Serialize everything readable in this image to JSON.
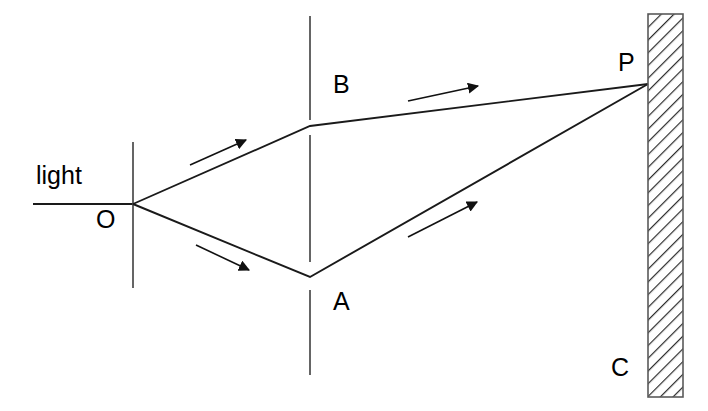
{
  "figure": {
    "background_color": "#ffffff",
    "line_color": "#1a1a1a",
    "width": 708,
    "height": 411
  },
  "labels": {
    "source": "light",
    "pinhole": "O",
    "slit_upper": "B",
    "slit_lower": "A",
    "screen_point": "P",
    "screen": "C"
  },
  "elements": {
    "incoming_ray": {
      "name": "incoming-light-ray",
      "x1": 33,
      "y1": 204,
      "x2": 133,
      "y2": 204
    },
    "first_barrier": {
      "name": "pinhole-barrier",
      "x": 133,
      "y1": 142,
      "y2": 288
    },
    "second_barrier_segments": [
      {
        "x": 310,
        "y1": 16,
        "y2": 120
      },
      {
        "x": 310,
        "y1": 135,
        "y2": 262
      },
      {
        "x": 310,
        "y1": 290,
        "y2": 375
      }
    ],
    "rays": [
      {
        "name": "ray-o-to-b",
        "points": "133,204 310,126"
      },
      {
        "name": "ray-b-to-p",
        "points": "310,126 648,84"
      },
      {
        "name": "ray-o-to-a",
        "points": "133,204 310,277"
      },
      {
        "name": "ray-a-to-p",
        "points": "310,277 648,84"
      }
    ],
    "arrows": [
      {
        "name": "arrow-o-to-b",
        "x": 232,
        "y": 143,
        "angle": -24
      },
      {
        "name": "arrow-b-to-p",
        "x": 462,
        "y": 90,
        "angle": -7
      },
      {
        "name": "arrow-o-to-a",
        "x": 237,
        "y": 267,
        "angle": 23
      },
      {
        "name": "arrow-a-to-p",
        "x": 466,
        "y": 210,
        "angle": -30
      }
    ],
    "screen": {
      "name": "observation-screen",
      "x": 648,
      "y": 14,
      "width": 35,
      "height": 383,
      "hatch_angle_deg": 45
    },
    "point_p": {
      "x": 648,
      "y": 84
    }
  },
  "label_positions": {
    "source": {
      "x": 36,
      "y": 163
    },
    "pinhole": {
      "x": 96,
      "y": 207
    },
    "slit_upper": {
      "x": 333,
      "y": 72
    },
    "slit_lower": {
      "x": 333,
      "y": 289
    },
    "screen_point": {
      "x": 618,
      "y": 50
    },
    "screen": {
      "x": 611,
      "y": 355
    }
  }
}
